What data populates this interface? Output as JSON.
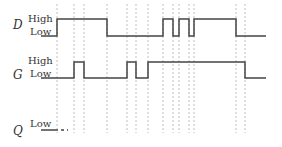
{
  "signals": [
    {
      "name": "D",
      "high_label": "High",
      "low_label": "Low"
    },
    {
      "name": "G",
      "high_label": "High",
      "low_label": "Low"
    },
    {
      "name": "Q",
      "low_label": "Low"
    }
  ],
  "colors": {
    "waveform": "#444444",
    "guide": "#b0b0b0",
    "text": "#333333"
  },
  "timing_marks_x": [
    57,
    74,
    84,
    107,
    127,
    136,
    148,
    163,
    173,
    179,
    189,
    194,
    236,
    245
  ],
  "waveforms": {
    "D": {
      "start_x": 41,
      "end_x": 266,
      "initial": "low",
      "transitions_x": [
        57,
        107,
        163,
        173,
        179,
        189,
        194,
        236
      ]
    },
    "G": {
      "start_x": 41,
      "end_x": 266,
      "initial": "low",
      "transitions_x": [
        74,
        84,
        127,
        136,
        148,
        245
      ]
    },
    "Q": {
      "start_x": 41,
      "solid_end_x": 55,
      "dashed_end_x": 68,
      "initial": "low"
    }
  }
}
